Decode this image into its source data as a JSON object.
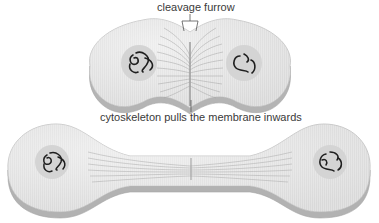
{
  "diagram": {
    "labels": {
      "cleavage_furrow": "cleavage furrow",
      "cytoskeleton": "cytoskeleton pulls the membrane inwards"
    },
    "stages": [
      {
        "name": "pinching-cell",
        "description": "two lobes joined at the cleavage furrow, cytoskeleton fibres converging at the midline"
      },
      {
        "name": "dividing-cell",
        "description": "two lobes connected by a thin bridge with cytoskeleton fibres"
      }
    ],
    "colors": {
      "cell_top": "#e4e4e4",
      "cell_edge": "#bdbdbd",
      "cell_shadow": "#a9a9a9",
      "nucleus": "#d6d6d6",
      "chromosome": "#222222",
      "fibre": "#9a9a9a",
      "text": "#3a3a3a",
      "leader_line": "#555555"
    }
  }
}
